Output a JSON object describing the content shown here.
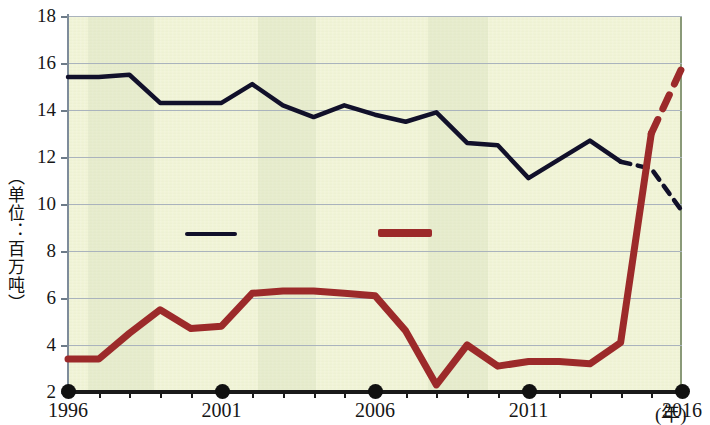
{
  "chart_data": {
    "type": "line",
    "title": "",
    "xlabel": "(年)",
    "ylabel": "（单位：百万吨）",
    "xlim": [
      1996,
      2016
    ],
    "ylim": [
      2,
      18
    ],
    "grid": true,
    "x": [
      1996,
      1997,
      1998,
      1999,
      2000,
      2001,
      2002,
      2003,
      2004,
      2005,
      2006,
      2007,
      2008,
      2009,
      2010,
      2011,
      2012,
      2013,
      2014,
      2015,
      2016
    ],
    "y_ticks": [
      2,
      4,
      6,
      8,
      10,
      12,
      14,
      16,
      18
    ],
    "x_tick_labels": [
      "1996",
      "2001",
      "2006",
      "2011",
      "2016"
    ],
    "x_tick_values": [
      1996,
      2001,
      2006,
      2011,
      2016
    ],
    "series": [
      {
        "name": "navy-series",
        "color": "#11102a",
        "values": [
          15.4,
          15.4,
          15.5,
          14.3,
          14.3,
          14.3,
          15.1,
          14.2,
          13.7,
          14.2,
          13.8,
          13.5,
          13.9,
          12.6,
          12.5,
          11.1,
          11.9,
          12.7,
          11.8,
          11.5,
          9.7
        ],
        "solid_through": 2014,
        "dashed_from": 2014,
        "style": "solid-then-dashed"
      },
      {
        "name": "dark-red-series",
        "color": "#9c2a2a",
        "values": [
          3.4,
          3.4,
          4.5,
          5.5,
          4.7,
          4.8,
          6.2,
          6.3,
          6.3,
          6.2,
          6.1,
          4.6,
          2.3,
          4.0,
          3.1,
          3.3,
          3.3,
          3.2,
          4.1,
          13.0,
          15.8
        ],
        "solid_through": 2015,
        "dashed_from": 2015,
        "style": "solid-then-dashed"
      }
    ],
    "legend": {
      "position": "inside-middle",
      "entries": [
        {
          "name": "navy-series",
          "color": "#11102a",
          "label": ""
        },
        {
          "name": "dark-red-series",
          "color": "#9c2a2a",
          "label": ""
        }
      ]
    },
    "background_color": "#f2f5d8",
    "gridline_color": "#aab3bd"
  },
  "axis": {
    "y_unit_caption": "（单位：百万吨）",
    "x_unit_caption": "(年)",
    "y_labels": [
      "18",
      "16",
      "14",
      "12",
      "10",
      "8",
      "6",
      "4",
      "2"
    ],
    "x_labels": [
      "1996",
      "2001",
      "2006",
      "2011",
      "2016"
    ]
  }
}
